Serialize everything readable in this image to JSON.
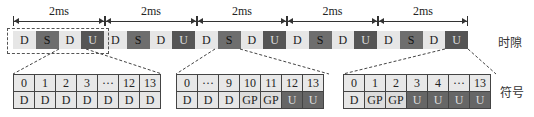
{
  "timeline": {
    "intervals": [
      {
        "label": "2ms",
        "left": 13,
        "width": 92
      },
      {
        "label": "2ms",
        "left": 105,
        "width": 92
      },
      {
        "label": "2ms",
        "left": 197,
        "width": 90
      },
      {
        "label": "2ms",
        "left": 287,
        "width": 91
      },
      {
        "label": "2ms",
        "left": 378,
        "width": 90
      }
    ],
    "slots": [
      "D",
      "S",
      "D",
      "U",
      "D",
      "S",
      "D",
      "U",
      "D",
      "S",
      "D",
      "U",
      "D",
      "S",
      "D",
      "U",
      "D",
      "S",
      "D",
      "U"
    ],
    "row_label": "时隙"
  },
  "symbol_tables": [
    {
      "indices": [
        "0",
        "1",
        "2",
        "3",
        "···",
        "12",
        "13"
      ],
      "types": [
        "D",
        "D",
        "D",
        "D",
        "D",
        "D",
        "D"
      ]
    },
    {
      "indices": [
        "0",
        "···",
        "9",
        "10",
        "11",
        "12",
        "13"
      ],
      "types": [
        "D",
        "D",
        "D",
        "GP",
        "GP",
        "U",
        "U"
      ]
    },
    {
      "indices": [
        "0",
        "1",
        "2",
        "3",
        "4",
        "···",
        "13"
      ],
      "types": [
        "D",
        "GP",
        "GP",
        "U",
        "U",
        "U",
        "U"
      ]
    }
  ],
  "symbol_label": "符号",
  "colors": {
    "D": "#e6e6e6",
    "S": "#6e6e6e",
    "U": "#555555",
    "GP": "#dcdcdc"
  }
}
